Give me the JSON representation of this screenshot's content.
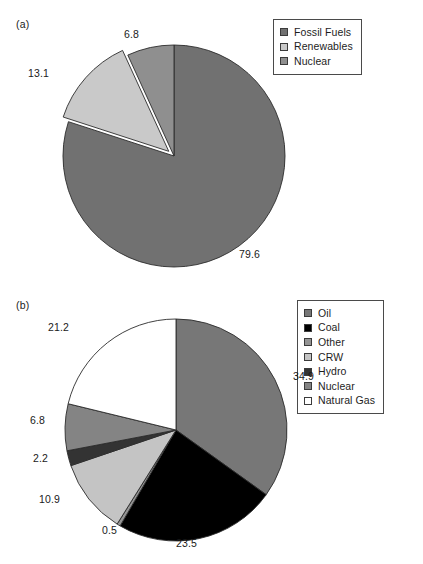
{
  "figure": {
    "panel_a_label": "(a)",
    "panel_b_label": "(b)"
  },
  "chart_data": [
    {
      "type": "pie",
      "id": "panel-a",
      "title": "(a)",
      "legend_position": "top-right",
      "total": 99.5,
      "categories": [
        "Fossil Fuels",
        "Renewables",
        "Nuclear"
      ],
      "values": [
        79.6,
        13.1,
        6.8
      ],
      "value_labels": [
        "79.6",
        "13.1",
        "6.8"
      ],
      "colors": [
        "#717171",
        "#c9c9c9",
        "#8f8f8f"
      ],
      "exploded": [
        "Renewables"
      ],
      "start_angle_deg": 0,
      "direction": "clockwise",
      "slices": [
        {
          "label": "Fossil Fuels",
          "value": 79.6,
          "value_label": "79.6",
          "color": "#717171",
          "exploded": false
        },
        {
          "label": "Renewables",
          "value": 13.1,
          "value_label": "13.1",
          "color": "#c9c9c9",
          "exploded": true
        },
        {
          "label": "Nuclear",
          "value": 6.8,
          "value_label": "6.8",
          "color": "#8f8f8f",
          "exploded": false
        }
      ]
    },
    {
      "type": "pie",
      "id": "panel-b",
      "title": "(b)",
      "legend_position": "right",
      "total": 100.0,
      "categories": [
        "Oil",
        "Coal",
        "Other",
        "CRW",
        "Hydro",
        "Nuclear",
        "Natural Gas"
      ],
      "values": [
        34.9,
        23.5,
        0.5,
        10.9,
        2.2,
        6.8,
        21.2
      ],
      "value_labels": [
        "34.9",
        "23.5",
        "0.5",
        "10.9",
        "2.2",
        "6.8",
        "21.2"
      ],
      "colors": [
        "#777777",
        "#000000",
        "#949494",
        "#c4c4c4",
        "#333333",
        "#848484",
        "#ffffff"
      ],
      "start_angle_deg": 0,
      "direction": "clockwise",
      "slices": [
        {
          "label": "Oil",
          "value": 34.9,
          "value_label": "34.9",
          "color": "#777777"
        },
        {
          "label": "Coal",
          "value": 23.5,
          "value_label": "23.5",
          "color": "#000000"
        },
        {
          "label": "Other",
          "value": 0.5,
          "value_label": "0.5",
          "color": "#949494"
        },
        {
          "label": "CRW",
          "value": 10.9,
          "value_label": "10.9",
          "color": "#c4c4c4"
        },
        {
          "label": "Hydro",
          "value": 2.2,
          "value_label": "2.2",
          "color": "#333333"
        },
        {
          "label": "Nuclear",
          "value": 6.8,
          "value_label": "6.8",
          "color": "#848484"
        },
        {
          "label": "Natural Gas",
          "value": 21.2,
          "value_label": "21.2",
          "color": "#ffffff"
        }
      ]
    }
  ],
  "panel_a": {
    "label": "(a)",
    "legend": {
      "items": [
        {
          "label": "Fossil Fuels",
          "color": "#717171"
        },
        {
          "label": "Renewables",
          "color": "#c9c9c9"
        },
        {
          "label": "Nuclear",
          "color": "#8f8f8f"
        }
      ]
    },
    "labels": [
      {
        "text": "6.8",
        "x": 124,
        "y": 28
      },
      {
        "text": "13.1",
        "x": 28,
        "y": 67
      },
      {
        "text": "79.6",
        "x": 239,
        "y": 248
      }
    ]
  },
  "panel_b": {
    "label": "(b)",
    "legend": {
      "items": [
        {
          "label": "Oil",
          "color": "#777777"
        },
        {
          "label": "Coal",
          "color": "#000000"
        },
        {
          "label": "Other",
          "color": "#949494"
        },
        {
          "label": "CRW",
          "color": "#c4c4c4"
        },
        {
          "label": "Hydro",
          "color": "#333333"
        },
        {
          "label": "Nuclear",
          "color": "#848484"
        },
        {
          "label": "Natural Gas",
          "color": "#ffffff"
        }
      ]
    },
    "labels": [
      {
        "text": "21.2",
        "x": 48,
        "y": 321
      },
      {
        "text": "34.9",
        "x": 293,
        "y": 370
      },
      {
        "text": "6.8",
        "x": 30,
        "y": 414
      },
      {
        "text": "2.2",
        "x": 33,
        "y": 452
      },
      {
        "text": "10.9",
        "x": 39,
        "y": 493
      },
      {
        "text": "0.5",
        "x": 102,
        "y": 524
      },
      {
        "text": "23.5",
        "x": 176,
        "y": 537
      }
    ]
  }
}
